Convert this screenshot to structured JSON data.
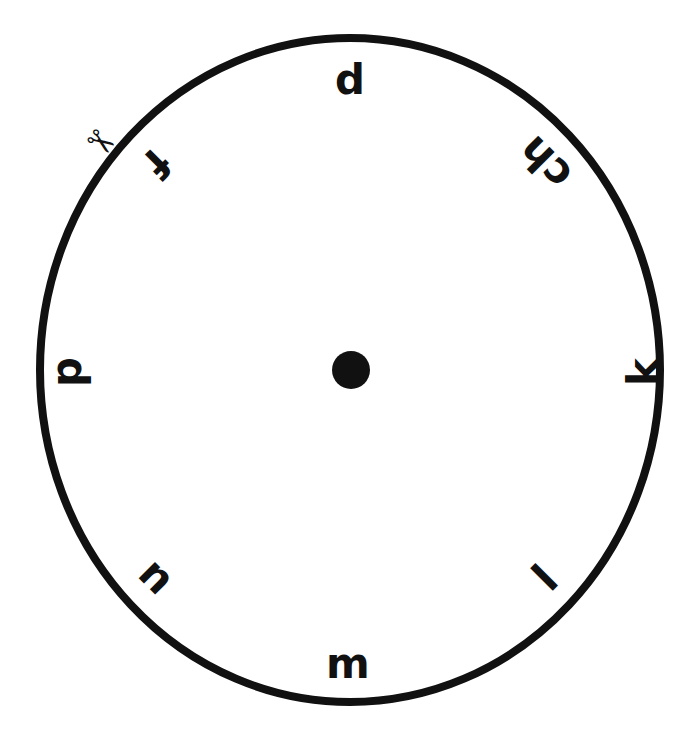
{
  "page": {
    "background_color": "#ffffff",
    "ink_color": "#111111",
    "width": 698,
    "height": 729
  },
  "wheel": {
    "name": "letter-wheel",
    "circle": {
      "center_x": 350,
      "center_y": 370,
      "radius_x": 310,
      "radius_y": 332,
      "stroke_width": 8,
      "stroke_color": "#111111",
      "fill": "none"
    },
    "hub": {
      "label": "center-pivot-dot",
      "center_x": 351,
      "center_y": 370,
      "radius": 19,
      "color": "#111111"
    },
    "cut_mark": {
      "icon": "scissors-icon",
      "glyph": "✂",
      "x": 101,
      "y": 142,
      "rotation": 35,
      "font_size": 34
    },
    "letters": [
      {
        "text": "p",
        "x": 350,
        "y": 85,
        "rotation": 180,
        "font_size": 42
      },
      {
        "text": "ch",
        "x": 545,
        "y": 163,
        "rotation": -135,
        "font_size": 42
      },
      {
        "text": "k",
        "x": 643,
        "y": 372,
        "rotation": -90,
        "font_size": 42
      },
      {
        "text": "l",
        "x": 545,
        "y": 578,
        "rotation": -45,
        "font_size": 42
      },
      {
        "text": "m",
        "x": 348,
        "y": 663,
        "rotation": 0,
        "font_size": 42
      },
      {
        "text": "n",
        "x": 157,
        "y": 576,
        "rotation": 45,
        "font_size": 42
      },
      {
        "text": "d",
        "x": 72,
        "y": 372,
        "rotation": 90,
        "font_size": 42
      },
      {
        "text": "f",
        "x": 157,
        "y": 163,
        "rotation": 135,
        "font_size": 42
      }
    ]
  }
}
